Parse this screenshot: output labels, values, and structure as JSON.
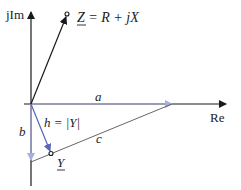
{
  "diagram": {
    "axes": {
      "imag_label": "jIm",
      "real_label": "Re"
    },
    "impedance": {
      "symbol": "Z",
      "equation_rest": " = R + jX"
    },
    "admittance": {
      "symbol": "Y"
    },
    "segments": {
      "a": "a",
      "b": "b",
      "c": "c",
      "h_left": "h = ",
      "h_abs": "|Y|"
    },
    "colors": {
      "axis": "#1a1a1a",
      "projection": "#a9aee0",
      "hypotenuse": "#555555",
      "h_arrow": "#5a66b8",
      "z_vector": "#1a1a1a"
    }
  }
}
